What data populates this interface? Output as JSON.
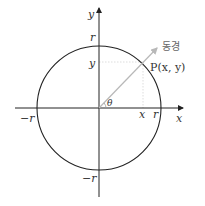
{
  "diagram": {
    "type": "unit-circle-angle",
    "axes": {
      "x_label": "x",
      "y_label": "y"
    },
    "circle": {
      "radius_label": "r",
      "intercepts": {
        "right": "r",
        "left": "−r",
        "top": "r",
        "bottom": "−r"
      }
    },
    "point": {
      "name": "P",
      "coords_label": "P(x, y)",
      "x_projection_label": "x",
      "y_projection_label": "y"
    },
    "ray": {
      "label": "동경",
      "color": "#b8b8b8"
    },
    "angle": {
      "label": "θ"
    },
    "colors": {
      "axis": "#222222",
      "circle": "#222222",
      "guide": "#cccccc"
    }
  }
}
